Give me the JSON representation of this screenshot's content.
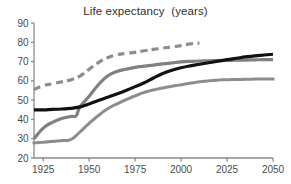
{
  "chart_data": {
    "type": "line",
    "title": "Life expectancy  (years)",
    "xlabel": "",
    "ylabel": "",
    "xlim": [
      1920,
      2050
    ],
    "ylim": [
      20,
      90
    ],
    "grid": false,
    "legend": "none",
    "x_ticks": [
      1925,
      1950,
      1975,
      2000,
      2025,
      2050
    ],
    "x_tick_labels": [
      "1925",
      "1950",
      "1975",
      "2000",
      "2025",
      "2050"
    ],
    "y_ticks": [
      20,
      30,
      40,
      50,
      60,
      70,
      80,
      90
    ],
    "y_tick_labels": [
      "20",
      "30",
      "40",
      "50",
      "60",
      "70",
      "80",
      "90"
    ],
    "series": [
      {
        "name": "dashed-upper",
        "style": "dashed",
        "color": "#8c8c8c",
        "width": 3.2,
        "x": [
          1920,
          1925,
          1930,
          1935,
          1940,
          1945,
          1950,
          1955,
          1960,
          1965,
          1970,
          1975,
          1980,
          1985,
          1990,
          1995,
          2000,
          2005,
          2010
        ],
        "values": [
          55.5,
          57.5,
          58.5,
          59.5,
          60.5,
          62.5,
          66.0,
          69.5,
          72.0,
          73.5,
          74.3,
          74.8,
          75.6,
          76.3,
          77.0,
          77.6,
          78.3,
          79.2,
          79.6
        ]
      },
      {
        "name": "solid-gray",
        "style": "solid",
        "color": "#808080",
        "width": 3.2,
        "x": [
          1920,
          1925,
          1930,
          1935,
          1940,
          1943,
          1945,
          1950,
          1955,
          1960,
          1965,
          1970,
          1975,
          1980,
          1985,
          1990,
          1995,
          2000,
          2005,
          2010,
          2015,
          2020,
          2025,
          2030,
          2035,
          2040,
          2045,
          2050
        ],
        "values": [
          30.0,
          35.5,
          38.5,
          40.5,
          41.5,
          42.0,
          46.5,
          52.0,
          58.0,
          62.5,
          64.8,
          66.0,
          67.0,
          67.6,
          68.2,
          68.8,
          69.3,
          69.8,
          70.1,
          70.3,
          70.4,
          70.5,
          70.6,
          70.7,
          70.8,
          70.9,
          71.0,
          71.0
        ]
      },
      {
        "name": "solid-black",
        "style": "solid",
        "color": "#111111",
        "width": 3.2,
        "x": [
          1920,
          1925,
          1930,
          1935,
          1940,
          1945,
          1950,
          1955,
          1960,
          1965,
          1970,
          1975,
          1980,
          1985,
          1990,
          1995,
          2000,
          2005,
          2010,
          2015,
          2020,
          2025,
          2030,
          2035,
          2040,
          2045,
          2050
        ],
        "values": [
          45.0,
          45.0,
          45.2,
          45.4,
          45.7,
          46.5,
          48.0,
          49.8,
          51.5,
          53.2,
          55.0,
          57.0,
          59.0,
          61.5,
          63.8,
          65.5,
          66.8,
          67.8,
          68.6,
          69.4,
          70.2,
          71.0,
          71.7,
          72.4,
          73.0,
          73.4,
          73.8
        ]
      },
      {
        "name": "dotted-lower",
        "style": "dotted",
        "color": "#8c8c8c",
        "width": 3.0,
        "x": [
          1920,
          1925,
          1930,
          1935,
          1940,
          1945,
          1950,
          1955,
          1960,
          1965,
          1970,
          1975,
          1980,
          1985,
          1990,
          1995,
          2000,
          2005,
          2010,
          2015,
          2020,
          2025,
          2030,
          2035,
          2040,
          2045,
          2050
        ],
        "values": [
          27.8,
          28.2,
          28.6,
          29.0,
          29.6,
          33.5,
          38.0,
          42.0,
          45.5,
          48.0,
          50.2,
          52.2,
          54.0,
          55.3,
          56.3,
          57.2,
          58.0,
          58.8,
          59.5,
          60.0,
          60.4,
          60.6,
          60.7,
          60.8,
          60.9,
          61.0,
          61.0
        ]
      }
    ],
    "axis_color": "#8a8a8a",
    "title_color": "#2f2f2f",
    "background": "#ffffff"
  }
}
